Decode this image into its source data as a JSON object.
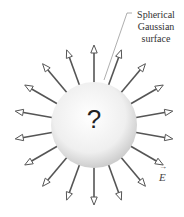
{
  "diagram": {
    "surface_label": "Spherical Gaussian surface",
    "surface_label_lines": [
      "Spherical",
      "Gaussian",
      "surface"
    ],
    "center_symbol": "?",
    "field_label": "E",
    "field_vector_marker": "→",
    "arrow_count": 18,
    "colors": {
      "arrow": "#555555",
      "sphere_light": "#ffffff",
      "sphere_dark": "#cfcfcf",
      "text": "#333333"
    }
  }
}
